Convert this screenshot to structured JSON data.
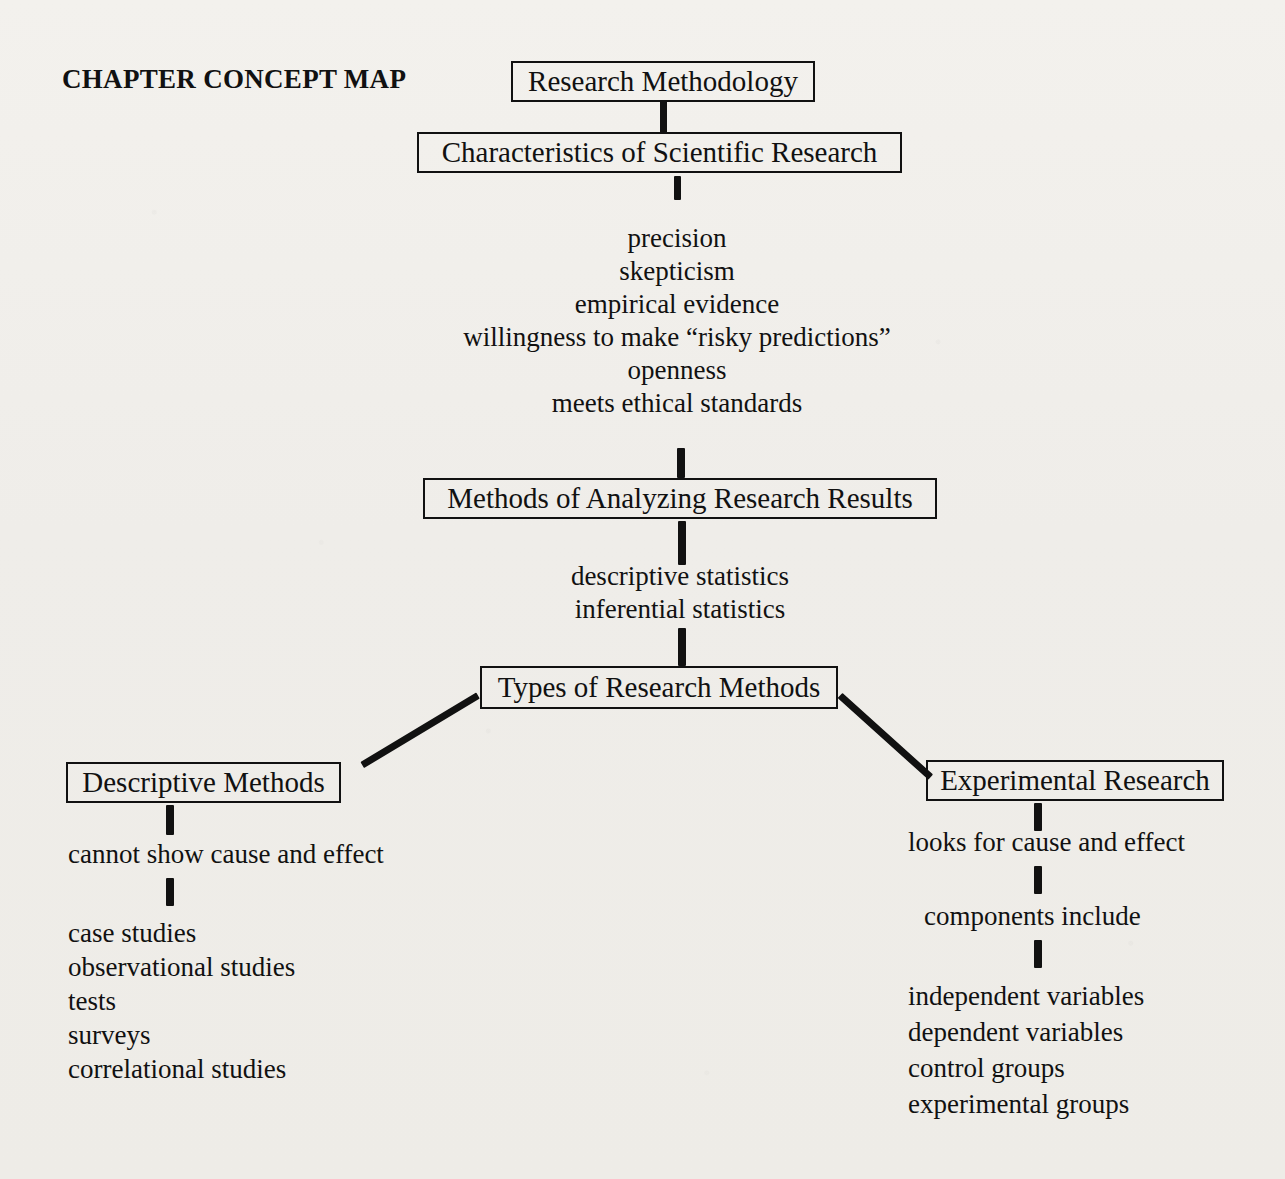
{
  "title": "CHAPTER CONCEPT MAP",
  "nodes": {
    "research_methodology": "Research Methodology",
    "characteristics": "Characteristics of Scientific Research",
    "methods_of_analyzing": "Methods of Analyzing Research Results",
    "types_of_research": "Types of Research Methods",
    "descriptive_methods": "Descriptive Methods",
    "experimental_research": "Experimental Research"
  },
  "characteristics_list": [
    "precision",
    "skepticism",
    "empirical evidence",
    "willingness to make “risky predictions”",
    "openness",
    "meets ethical standards"
  ],
  "analysis_list": [
    "descriptive statistics",
    "inferential statistics"
  ],
  "descriptive_branch": {
    "note": "cannot show cause and effect",
    "items": [
      "case studies",
      "observational studies",
      "tests",
      "surveys",
      "correlational studies"
    ]
  },
  "experimental_branch": {
    "note": "looks for cause and effect",
    "subheading": "components include",
    "items": [
      "independent variables",
      "dependent variables",
      "control groups",
      "experimental groups"
    ]
  },
  "colors": {
    "ink": "#111111",
    "paper": "#f1efeb"
  }
}
